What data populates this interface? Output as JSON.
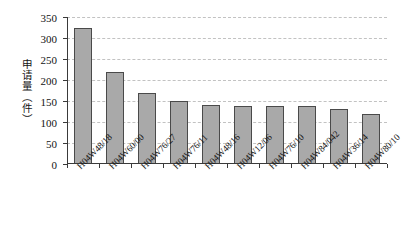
{
  "chart_data": {
    "type": "bar",
    "title": "",
    "subtitle": "",
    "xlabel": "",
    "ylabel": "申请量（件）",
    "ylim": [
      0,
      350
    ],
    "yticks": [
      0,
      50,
      100,
      150,
      200,
      250,
      300,
      350
    ],
    "grid": true,
    "legend": false,
    "orientation": "vertical",
    "bar_color": "#a9a9a9",
    "bar_edge_color": "#4a4a4a",
    "categories": [
      "H04W48/18",
      "H04W60/00",
      "H04W76/27",
      "H04W76/11",
      "H04W48/16",
      "H04W12/06",
      "H04W76/10",
      "H04W84/042",
      "H04W36/14",
      "H04W80/10"
    ],
    "values": [
      324,
      219,
      170,
      150,
      140,
      138,
      138,
      137,
      130,
      120
    ],
    "series": [
      {
        "name": "申请量",
        "values": [
          324,
          219,
          170,
          150,
          140,
          138,
          138,
          137,
          130,
          120
        ]
      }
    ]
  },
  "caption": {
    "text": ""
  }
}
